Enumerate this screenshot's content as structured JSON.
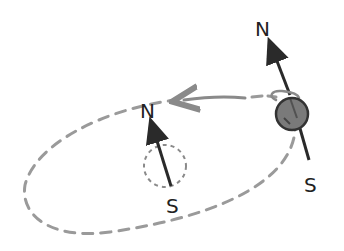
{
  "diagram": {
    "orbit": {
      "style": "dashed",
      "color": "#9a9a9a",
      "direction_arrow": "counterclockwise-top"
    },
    "planet": {
      "fill": "#7a7a7a",
      "stroke": "#333333",
      "axis_labels": {
        "north": "N",
        "south": "S"
      },
      "spin_indicator": "curl"
    },
    "center_axis": {
      "labels": {
        "north": "N",
        "south": "S"
      },
      "reference_circle": "dotted"
    },
    "colors": {
      "ink": "#222222",
      "dash": "#9a9a9a"
    }
  }
}
